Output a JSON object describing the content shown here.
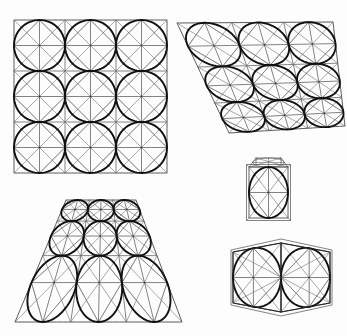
{
  "page": {
    "background": "#fdfdfd",
    "width": 347,
    "height": 336
  },
  "cut_header_text": "",
  "styles": {
    "circle_color": "#111111",
    "circle_width": 1.9,
    "grid_color": "#5a5a5a",
    "grid_width": 0.75,
    "diagonal_color": "#6e6e6e",
    "diagonal_width": 0.6,
    "outline_color": "#222222",
    "outline_width": 1.0
  },
  "chart_data": {
    "type": "diagram",
    "figures": [
      {
        "id": "figure-frontal-grid",
        "name": "frontal-3x3-grid",
        "label": "Frontal 3x3 grid of squares with inscribed circles",
        "rows": 3,
        "cols": 3,
        "projection": "orthographic",
        "quad": [
          [
            14,
            20
          ],
          [
            167,
            20
          ],
          [
            167,
            173
          ],
          [
            14,
            173
          ]
        ],
        "features": [
          "outer-square",
          "cell-squares",
          "inscribed-circles",
          "cell-diagonals",
          "inscribed-diamonds",
          "midlines"
        ]
      },
      {
        "id": "figure-sheared-grid",
        "name": "sheared-3x3-grid",
        "label": "Sheared 3x3 grid of squares with inscribed ellipses",
        "rows": 3,
        "cols": 3,
        "projection": "affine-shear",
        "quad": [
          [
            177,
            23
          ],
          [
            333,
            22
          ],
          [
            345,
            126
          ],
          [
            229,
            133
          ]
        ],
        "features": [
          "outer-quad",
          "cell-quads",
          "inscribed-ellipses",
          "cell-diagonals",
          "inscribed-diamonds",
          "midlines"
        ]
      },
      {
        "id": "figure-perspective-trapezoid",
        "name": "perspective-3x3-trapezoid",
        "label": "Perspective trapezoid 3x3 grid receding to a vanishing point",
        "rows": 3,
        "cols": 3,
        "projection": "one-point-perspective",
        "quad": [
          [
            15,
            322
          ],
          [
            182,
            322
          ],
          [
            136,
            200
          ],
          [
            66,
            200
          ]
        ],
        "features": [
          "outer-trapezoid",
          "cell-quads",
          "inscribed-ellipses",
          "cell-diagonals",
          "inscribed-diamonds",
          "midlines"
        ]
      },
      {
        "id": "figure-cube",
        "name": "single-cube",
        "label": "Single cube with inscribed circle on the front face",
        "rows": 1,
        "cols": 1,
        "projection": "perspective",
        "quad": [
          [
            249,
            167
          ],
          [
            288,
            167
          ],
          [
            288,
            218
          ],
          [
            249,
            218
          ]
        ],
        "top_face": [
          [
            249,
            167
          ],
          [
            288,
            167
          ],
          [
            281,
            158
          ],
          [
            256,
            158
          ]
        ],
        "features": [
          "cube-front-face",
          "cube-top-face",
          "inscribed-circle",
          "diagonals",
          "inscribed-diamond",
          "midlines"
        ]
      },
      {
        "id": "figure-pair",
        "name": "two-cell-pair",
        "label": "Two adjacent cells in slight perspective with inscribed circles",
        "rows": 1,
        "cols": 2,
        "projection": "slight-perspective",
        "quad": [
          [
            233,
            252
          ],
          [
            281,
            243
          ],
          [
            330,
            252
          ],
          [
            330,
            303
          ],
          [
            281,
            312
          ],
          [
            233,
            303
          ]
        ],
        "features": [
          "outer-hexagonal-outline",
          "cell-quads",
          "inscribed-circles",
          "cell-diagonals",
          "inscribed-diamonds",
          "midlines"
        ]
      }
    ]
  }
}
